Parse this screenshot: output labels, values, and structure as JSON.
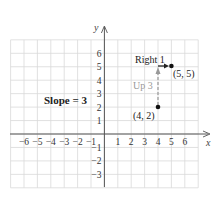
{
  "diagram": {
    "type": "coordinate-plane",
    "axes": {
      "x_label": "x",
      "y_label": "y"
    },
    "x_ticks": [
      "-6",
      "-5",
      "-4",
      "-3",
      "-2",
      "-1",
      "1",
      "2",
      "3",
      "4",
      "5",
      "6"
    ],
    "y_ticks": [
      "6",
      "5",
      "4",
      "3",
      "2",
      "1",
      "-1",
      "-2",
      "-3"
    ],
    "slope_label": "Slope = 3",
    "points": [
      {
        "label": "(4, 2)",
        "x": 4,
        "y": 2
      },
      {
        "label": "(5, 5)",
        "x": 5,
        "y": 5
      }
    ],
    "rise_label": "Up 3",
    "run_label": "Right 1",
    "colors": {
      "grid": "#d9d9d9",
      "axis": "#555555",
      "rise_arrow": "#999999",
      "run_arrow": "#222222",
      "point": "#111111"
    }
  }
}
